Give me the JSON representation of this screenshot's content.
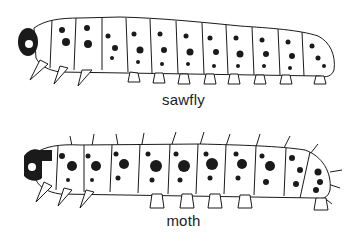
{
  "figure": {
    "panels": [
      {
        "id": "sawfly",
        "label": "sawfly",
        "description": "sawfly larva: many prolegs (abdominal legs on most segments), dark head with single eye spot, spotted body"
      },
      {
        "id": "moth",
        "label": "moth",
        "description": "moth caterpillar: fewer prolegs, bristly setae, large dark spots, dark head capsule"
      }
    ]
  },
  "colors": {
    "ink": "#1a1a1a",
    "body": "#ffffff",
    "label": "#222222"
  }
}
